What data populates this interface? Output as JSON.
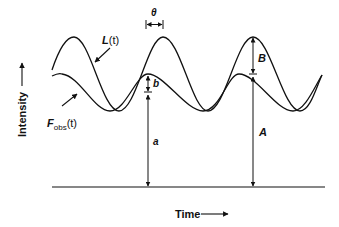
{
  "diagram": {
    "axes": {
      "y_label": "Intensity",
      "x_label": "Time"
    },
    "curves": {
      "excitation": {
        "label_main": "L",
        "label_arg": "(t)"
      },
      "emission": {
        "label_main": "F",
        "label_sub": "obs",
        "label_arg": "(t)"
      }
    },
    "annotations": {
      "phase_shift": "θ",
      "emission_ac": "b",
      "emission_dc": "a",
      "excitation_ac": "B",
      "excitation_dc": "A"
    },
    "colors": {
      "ink": "#111111",
      "background": "#ffffff"
    }
  }
}
